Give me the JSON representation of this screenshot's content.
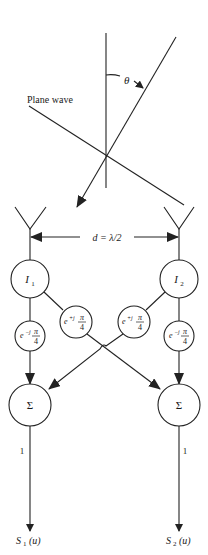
{
  "diagram": {
    "wave_label": "Plane wave",
    "angle_label": "θ",
    "spacing_label": "d = λ/2",
    "elements": [
      {
        "id": "I1",
        "symbol": "I",
        "subscript": "1"
      },
      {
        "id": "I2",
        "symbol": "I",
        "subscript": "2"
      }
    ],
    "phase_shifters": {
      "straight_left": {
        "base": "e",
        "exp": "−j",
        "num": "π",
        "den": "4"
      },
      "cross_left": {
        "base": "e",
        "exp": "+j",
        "num": "π",
        "den": "4"
      },
      "cross_right": {
        "base": "e",
        "exp": "+j",
        "num": "π",
        "den": "4"
      },
      "straight_right": {
        "base": "e",
        "exp": "−j",
        "num": "π",
        "den": "4"
      }
    },
    "summers": [
      {
        "id": "sum1",
        "symbol": "Σ"
      },
      {
        "id": "sum2",
        "symbol": "Σ"
      }
    ],
    "output_gain": [
      "1",
      "1"
    ],
    "outputs": [
      {
        "symbol": "S",
        "subscript": "1",
        "arg": "(u)"
      },
      {
        "symbol": "S",
        "subscript": "2",
        "arg": "(u)"
      }
    ]
  }
}
